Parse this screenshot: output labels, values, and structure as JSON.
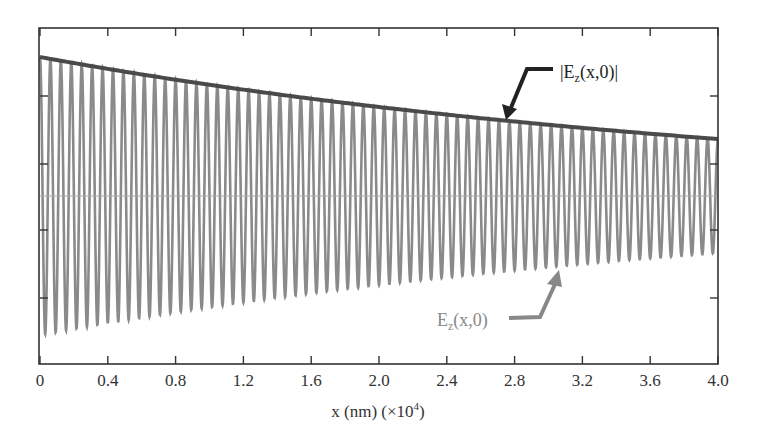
{
  "chart_data": {
    "type": "line",
    "title": "",
    "xlabel": "x (nm) (×10⁴)",
    "xlabel_parts": {
      "main": "x (nm) (×10",
      "sup": "4",
      "end": ")"
    },
    "ylabel": "",
    "xlim": [
      0,
      4.0
    ],
    "ylim": [
      -1.15,
      1.15
    ],
    "x_ticks": [
      "0",
      "0.4",
      "0.8",
      "1.2",
      "1.6",
      "2.0",
      "2.4",
      "2.8",
      "3.2",
      "3.6",
      "4.0"
    ],
    "y_ticks_unlabeled": [
      0.75,
      0.4,
      -0.4,
      -0.75
    ],
    "grid": false,
    "legend": "none (inline annotations)",
    "series": [
      {
        "name": "E_z(x,0)",
        "kind": "damped oscillation",
        "color": "#8a8a8a",
        "amplitude_at_0": 1.0,
        "amplitude_at_4": 0.41,
        "cycles_over_range": 65,
        "wavelength_x1e4nm": 0.0615
      },
      {
        "name": "|E_z(x,0)|",
        "kind": "exponential envelope",
        "color": "#4a4a4a",
        "x": [
          0,
          0.4,
          0.8,
          1.2,
          1.6,
          2.0,
          2.4,
          2.8,
          3.2,
          3.6,
          4.0
        ],
        "values": [
          1.0,
          0.914,
          0.835,
          0.763,
          0.698,
          0.638,
          0.583,
          0.533,
          0.487,
          0.445,
          0.41
        ]
      }
    ],
    "annotations": [
      {
        "text": "|E_z(x,0)|",
        "main": "|E",
        "sub": "z",
        "rest": "(x,0)|",
        "arrow_to_x": 2.75,
        "color": "#222222"
      },
      {
        "text": "E_z(x,0)",
        "main": "E",
        "sub": "z",
        "rest": "(x,0)",
        "arrow_to_x": 3.05,
        "color": "#888888"
      }
    ]
  }
}
